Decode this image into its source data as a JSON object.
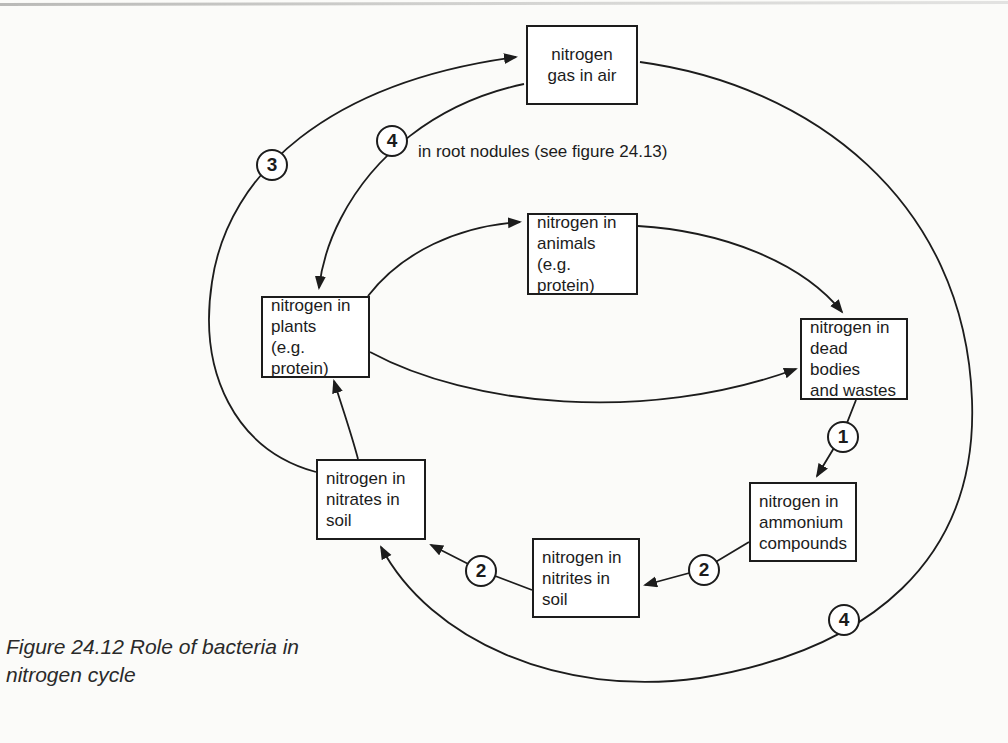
{
  "figure": {
    "caption_line1": "Figure 24.12  Role of bacteria in",
    "caption_line2": "nitrogen cycle"
  },
  "annotation": "in root nodules (see figure 24.13)",
  "boxes": {
    "gas": "nitrogen\ngas in air",
    "animals": "nitrogen in\nanimals\n(e.g. protein)",
    "plants": "nitrogen in\nplants\n(e.g. protein)",
    "dead_bodies": "nitrogen in\ndead bodies\nand wastes",
    "ammonium": "nitrogen in\nammonium\ncompounds",
    "nitrites": "nitrogen in\nnitrites in\nsoil",
    "nitrates": "nitrogen in\nnitrates in\nsoil"
  },
  "badges": {
    "step1_decay": "1",
    "step2_to_nitrites": "2",
    "step2_to_nitrates": "2",
    "step3_denitrify": "3",
    "step4_root_nodules": "4",
    "step4_soil_fixation": "4"
  },
  "colors": {
    "ink": "#1c1c1c",
    "paper": "#fbfbf9"
  }
}
